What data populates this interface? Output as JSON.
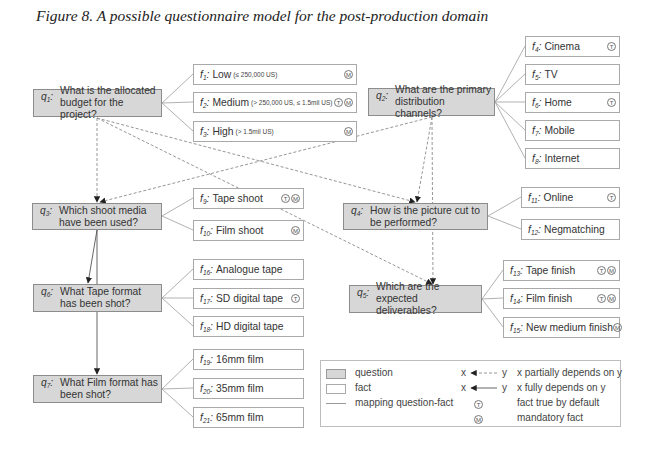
{
  "title": "Figure 8. A possible questionnaire model for the post-production domain",
  "questions": [
    {
      "label": "q",
      "sub": "1",
      "lines": [
        "What is the allocated",
        "budget for the project?"
      ]
    },
    {
      "label": "q",
      "sub": "2",
      "lines": [
        "What are the primary",
        "distribution channels?"
      ]
    },
    {
      "label": "q",
      "sub": "3",
      "lines": [
        "Which shoot media",
        "have been used?"
      ]
    },
    {
      "label": "q",
      "sub": "4",
      "lines": [
        "How is the picture cut to",
        "be performed?"
      ]
    },
    {
      "label": "q",
      "sub": "5",
      "lines": [
        "Which are the expected",
        "deliverables?"
      ]
    },
    {
      "label": "q",
      "sub": "6",
      "lines": [
        "What Tape format",
        "has been shot?"
      ]
    },
    {
      "label": "q",
      "sub": "7",
      "lines": [
        "What Film format has",
        "been shot?"
      ]
    }
  ],
  "facts": [
    {
      "label": "f",
      "sub": "1",
      "text": "Low",
      "note": "(≤ 250,000 US)",
      "badges": [
        "M"
      ]
    },
    {
      "label": "f",
      "sub": "2",
      "text": "Medium",
      "note": "(> 250,000 US, ≤ 1.5mil US)",
      "badges": [
        "T",
        "M"
      ]
    },
    {
      "label": "f",
      "sub": "3",
      "text": "High",
      "note": "(> 1.5mil US)",
      "badges": [
        "M"
      ]
    },
    {
      "label": "f",
      "sub": "4",
      "text": "Cinema",
      "badges": [
        "T"
      ]
    },
    {
      "label": "f",
      "sub": "5",
      "text": "TV",
      "badges": []
    },
    {
      "label": "f",
      "sub": "6",
      "text": "Home",
      "badges": [
        "T"
      ]
    },
    {
      "label": "f",
      "sub": "7",
      "text": "Mobile",
      "badges": []
    },
    {
      "label": "f",
      "sub": "8",
      "text": "Internet",
      "badges": []
    },
    {
      "label": "f",
      "sub": "9",
      "text": "Tape shoot",
      "badges": [
        "T",
        "M"
      ]
    },
    {
      "label": "f",
      "sub": "10",
      "text": "Film shoot",
      "badges": [
        "M"
      ]
    },
    {
      "label": "f",
      "sub": "11",
      "text": "Online",
      "badges": [
        "T"
      ]
    },
    {
      "label": "f",
      "sub": "12",
      "text": "Negmatching",
      "badges": []
    },
    {
      "label": "f",
      "sub": "13",
      "text": "Tape finish",
      "badges": [
        "T",
        "M"
      ]
    },
    {
      "label": "f",
      "sub": "14",
      "text": "Film finish",
      "badges": [
        "T",
        "M"
      ]
    },
    {
      "label": "f",
      "sub": "15",
      "text": "New medium finish",
      "badges": [
        "M"
      ]
    },
    {
      "label": "f",
      "sub": "16",
      "text": "Analogue tape",
      "badges": []
    },
    {
      "label": "f",
      "sub": "17",
      "text": "SD digital tape",
      "badges": [
        "T"
      ]
    },
    {
      "label": "f",
      "sub": "18",
      "text": "HD digital tape",
      "badges": []
    },
    {
      "label": "f",
      "sub": "19",
      "text": "16mm film",
      "badges": []
    },
    {
      "label": "f",
      "sub": "20",
      "text": "35mm film",
      "badges": []
    },
    {
      "label": "f",
      "sub": "21",
      "text": "65mm film",
      "badges": []
    }
  ],
  "legend": {
    "question": "question",
    "fact": "fact",
    "mapping": "mapping question-fact",
    "x": "x",
    "y": "y",
    "partial": "x partially depends on y",
    "full": "x fully depends on y",
    "badge_t": "T",
    "badge_m": "M",
    "true_default": "fact true by default",
    "mandatory": "mandatory fact"
  },
  "colors": {
    "question_fill": "#d7d7d7",
    "question_border": "#8c8c8c",
    "fact_border": "#a9a9a9",
    "mapping_line": "#a8a8a8",
    "dependency_line": "#8a8a8a",
    "arrowhead": "#222222"
  }
}
